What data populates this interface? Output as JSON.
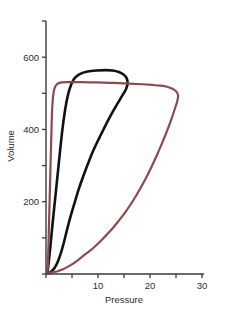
{
  "chart_data": {
    "type": "line",
    "title": "",
    "xlabel": "Pressure",
    "ylabel": "Volume",
    "xlim": [
      0,
      30
    ],
    "ylim": [
      0,
      700
    ],
    "grid": false,
    "legend": "none",
    "x_ticks": [
      0,
      5,
      10,
      15,
      20,
      25,
      30
    ],
    "x_tick_labels": [
      "",
      "",
      "10",
      "",
      "20",
      "",
      "30"
    ],
    "y_ticks": [
      0,
      100,
      200,
      300,
      400,
      500,
      600,
      700
    ],
    "y_tick_labels": [
      "",
      "",
      "200",
      "",
      "400",
      "",
      "600",
      ""
    ],
    "series": [
      {
        "name": "black-loop",
        "color": "#111111",
        "linewidth": 2.6,
        "closed": true,
        "points": [
          [
            0.3,
            5
          ],
          [
            0.5,
            30
          ],
          [
            0.8,
            70
          ],
          [
            1.2,
            130
          ],
          [
            1.7,
            200
          ],
          [
            2.2,
            270
          ],
          [
            2.7,
            340
          ],
          [
            3.2,
            405
          ],
          [
            3.8,
            465
          ],
          [
            4.5,
            510
          ],
          [
            5.4,
            540
          ],
          [
            6.5,
            553
          ],
          [
            8.0,
            560
          ],
          [
            9.8,
            563
          ],
          [
            11.5,
            564
          ],
          [
            12.8,
            563
          ],
          [
            14.0,
            559
          ],
          [
            14.9,
            552
          ],
          [
            15.5,
            542
          ],
          [
            15.7,
            528
          ],
          [
            15.4,
            512
          ],
          [
            14.6,
            492
          ],
          [
            13.6,
            468
          ],
          [
            12.5,
            440
          ],
          [
            11.4,
            410
          ],
          [
            10.3,
            378
          ],
          [
            9.2,
            345
          ],
          [
            8.2,
            310
          ],
          [
            7.2,
            272
          ],
          [
            6.3,
            235
          ],
          [
            5.5,
            197
          ],
          [
            4.7,
            158
          ],
          [
            4.0,
            120
          ],
          [
            3.4,
            85
          ],
          [
            2.8,
            55
          ],
          [
            2.2,
            32
          ],
          [
            1.6,
            16
          ],
          [
            1.0,
            7
          ],
          [
            0.5,
            3
          ],
          [
            0.3,
            5
          ]
        ]
      },
      {
        "name": "red-loop",
        "color": "#8c4a4f",
        "linewidth": 2.2,
        "closed": true,
        "points": [
          [
            0.3,
            4
          ],
          [
            0.4,
            40
          ],
          [
            0.5,
            95
          ],
          [
            0.6,
            150
          ],
          [
            0.7,
            205
          ],
          [
            0.8,
            260
          ],
          [
            0.9,
            315
          ],
          [
            1.0,
            370
          ],
          [
            1.1,
            420
          ],
          [
            1.2,
            460
          ],
          [
            1.35,
            490
          ],
          [
            1.6,
            512
          ],
          [
            2.1,
            525
          ],
          [
            3.0,
            530
          ],
          [
            4.5,
            531
          ],
          [
            7.0,
            531
          ],
          [
            10.0,
            530
          ],
          [
            13.0,
            529
          ],
          [
            16.0,
            527
          ],
          [
            18.5,
            525
          ],
          [
            20.5,
            523
          ],
          [
            22.0,
            521
          ],
          [
            23.3,
            518
          ],
          [
            24.2,
            513
          ],
          [
            24.9,
            507
          ],
          [
            25.3,
            499
          ],
          [
            25.4,
            490
          ],
          [
            25.2,
            476
          ],
          [
            24.8,
            458
          ],
          [
            24.3,
            436
          ],
          [
            23.7,
            412
          ],
          [
            23.0,
            386
          ],
          [
            22.2,
            358
          ],
          [
            21.3,
            328
          ],
          [
            20.3,
            297
          ],
          [
            19.2,
            265
          ],
          [
            18.0,
            233
          ],
          [
            16.7,
            202
          ],
          [
            15.3,
            172
          ],
          [
            13.8,
            144
          ],
          [
            12.3,
            118
          ],
          [
            10.7,
            94
          ],
          [
            9.1,
            72
          ],
          [
            7.5,
            54
          ],
          [
            6.1,
            38
          ],
          [
            4.9,
            26
          ],
          [
            3.8,
            17
          ],
          [
            2.9,
            11
          ],
          [
            2.1,
            7
          ],
          [
            1.4,
            5
          ],
          [
            0.8,
            4
          ],
          [
            0.3,
            4
          ]
        ]
      }
    ]
  },
  "axes": {
    "x_title": "Pressure",
    "y_title": "Volume"
  }
}
